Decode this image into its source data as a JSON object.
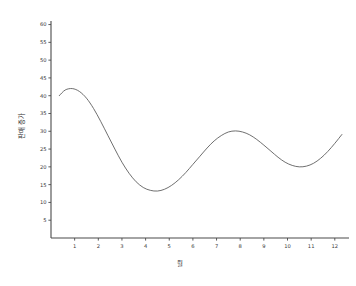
{
  "chart_data": {
    "type": "line",
    "title": "",
    "xlabel": "월",
    "ylabel": "판매 증가",
    "xlim": [
      0,
      12.6
    ],
    "ylim": [
      0,
      61
    ],
    "grid": false,
    "legend": false,
    "x_ticks": [
      1,
      2,
      3,
      4,
      5,
      6,
      7,
      8,
      9,
      10,
      11,
      12
    ],
    "x_tick_labels": [
      "1",
      "2",
      "3",
      "4",
      "5",
      "6",
      "7",
      "8",
      "9",
      "10",
      "11",
      "12"
    ],
    "y_ticks": [
      5,
      10,
      15,
      20,
      25,
      30,
      35,
      40,
      45,
      50,
      55,
      60
    ],
    "y_tick_labels": [
      "5",
      "10",
      "15",
      "20",
      "25",
      "30",
      "35",
      "40",
      "45",
      "50",
      "55",
      "60"
    ],
    "line_color": "#555555",
    "series": [
      {
        "name": "판매 증가",
        "x": [
          0.35,
          0.6,
          0.9,
          1.2,
          1.5,
          1.8,
          2.1,
          2.4,
          2.7,
          3.0,
          3.3,
          3.6,
          3.9,
          4.2,
          4.5,
          4.8,
          5.1,
          5.4,
          5.7,
          6.0,
          6.3,
          6.6,
          6.9,
          7.2,
          7.5,
          7.8,
          8.1,
          8.4,
          8.7,
          9.0,
          9.3,
          9.6,
          9.9,
          10.2,
          10.5,
          10.8,
          11.1,
          11.4,
          11.7,
          12.0,
          12.3
        ],
        "y": [
          40.0,
          41.6,
          42.0,
          41.2,
          39.3,
          36.4,
          32.8,
          28.9,
          25.0,
          21.3,
          18.2,
          15.8,
          14.2,
          13.4,
          13.2,
          13.7,
          14.8,
          16.4,
          18.4,
          20.7,
          23.0,
          25.3,
          27.3,
          28.8,
          29.8,
          30.1,
          29.8,
          29.0,
          27.7,
          26.1,
          24.4,
          22.7,
          21.3,
          20.4,
          20.0,
          20.2,
          21.0,
          22.4,
          24.3,
          26.6,
          29.1
        ]
      }
    ]
  },
  "axes": {
    "x_axis_name": "month-axis",
    "y_axis_name": "sales-increase-axis"
  }
}
